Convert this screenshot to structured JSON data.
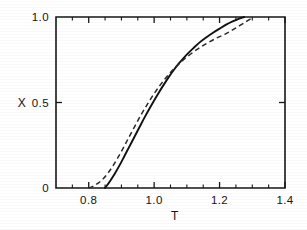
{
  "figure": {
    "background_color": "#ffffff",
    "ink_color": "#141414"
  },
  "chart_data": {
    "type": "line",
    "title": "",
    "subtitle": "",
    "xlabel": "T",
    "ylabel": "X",
    "xlim": [
      0.7,
      1.4
    ],
    "ylim": [
      0.0,
      1.0
    ],
    "grid": false,
    "legend_position": "none",
    "x_ticks_major": [
      0.8,
      1.0,
      1.2,
      1.4
    ],
    "x_tick_labels": [
      "0.8",
      "1.0",
      "1.2",
      "1.4"
    ],
    "x_ticks_minor": [
      0.75,
      0.85,
      0.9,
      0.95,
      1.05,
      1.1,
      1.15,
      1.25,
      1.3,
      1.35
    ],
    "y_ticks_major": [
      0.0,
      0.5,
      1.0
    ],
    "y_tick_labels": [
      "0",
      "0.5",
      "1.0"
    ],
    "y_ticks_minor": [],
    "frame": "box",
    "tick_direction": "in",
    "annotations": [],
    "series": [
      {
        "name": "solid-curve",
        "style": "solid",
        "color": "#111111",
        "x": [
          0.85,
          0.865,
          0.88,
          0.895,
          0.91,
          0.925,
          0.94,
          0.955,
          0.97,
          0.985,
          1.0,
          1.015,
          1.03,
          1.045,
          1.06,
          1.075,
          1.09,
          1.105,
          1.12,
          1.14,
          1.16,
          1.18,
          1.2,
          1.22,
          1.24,
          1.26,
          1.275
        ],
        "y": [
          0.0,
          0.04,
          0.085,
          0.135,
          0.19,
          0.245,
          0.3,
          0.355,
          0.41,
          0.462,
          0.512,
          0.56,
          0.606,
          0.65,
          0.69,
          0.727,
          0.76,
          0.79,
          0.818,
          0.853,
          0.882,
          0.908,
          0.932,
          0.955,
          0.974,
          0.99,
          1.0
        ]
      },
      {
        "name": "dashed-curve",
        "style": "dashed",
        "color": "#2a2a2a",
        "x": [
          0.8,
          0.815,
          0.83,
          0.845,
          0.86,
          0.875,
          0.89,
          0.905,
          0.92,
          0.94,
          0.96,
          0.98,
          1.0,
          1.02,
          1.04,
          1.06,
          1.08,
          1.1,
          1.13,
          1.16,
          1.19,
          1.22,
          1.25,
          1.28,
          1.3
        ],
        "y": [
          0.0,
          0.012,
          0.03,
          0.055,
          0.09,
          0.132,
          0.18,
          0.232,
          0.286,
          0.358,
          0.428,
          0.492,
          0.552,
          0.606,
          0.654,
          0.696,
          0.733,
          0.766,
          0.809,
          0.845,
          0.876,
          0.903,
          0.936,
          0.972,
          0.995
        ]
      }
    ]
  }
}
